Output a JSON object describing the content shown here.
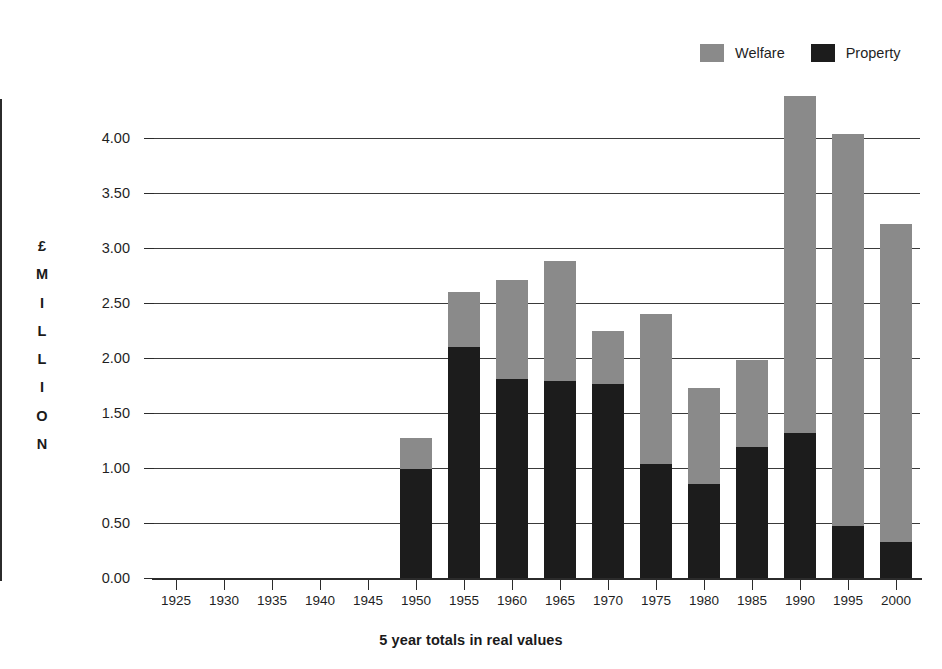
{
  "chart_data": {
    "type": "bar",
    "subtype": "stacked-bar",
    "title": "",
    "xlabel": "5 year totals in real values",
    "ylabel": "£ MILLION",
    "ylabel_letters": [
      "£",
      "M",
      "I",
      "L",
      "L",
      "I",
      "O",
      "N"
    ],
    "categories": [
      "1925",
      "1930",
      "1935",
      "1940",
      "1945",
      "1950",
      "1955",
      "1960",
      "1965",
      "1970",
      "1975",
      "1980",
      "1985",
      "1990",
      "1995",
      "2000"
    ],
    "series": [
      {
        "name": "Property",
        "color": "#1c1c1c",
        "values": [
          0,
          0,
          0,
          0,
          0,
          0.99,
          2.1,
          1.81,
          1.79,
          1.76,
          1.04,
          0.85,
          1.19,
          1.32,
          0.47,
          0.33
        ]
      },
      {
        "name": "Welfare",
        "color": "#8a8a8a",
        "values": [
          0,
          0,
          0,
          0,
          0,
          0.28,
          0.5,
          0.9,
          1.09,
          0.49,
          1.36,
          0.88,
          0.79,
          3.06,
          3.57,
          2.89
        ]
      }
    ],
    "totals": [
      0,
      0,
      0,
      0,
      0,
      1.27,
      2.6,
      2.71,
      2.88,
      2.25,
      2.4,
      1.73,
      1.98,
      4.38,
      4.04,
      3.22
    ],
    "ylim": [
      0,
      4.5
    ],
    "ytick_labels": [
      "0.00",
      "0.50",
      "1.00",
      "1.50",
      "2.00",
      "2.50",
      "3.00",
      "3.50",
      "4.00"
    ],
    "ytick_values": [
      0,
      0.5,
      1.0,
      1.5,
      2.0,
      2.5,
      3.0,
      3.5,
      4.0
    ],
    "grid": true,
    "grid_axis": "y",
    "legend": {
      "position": "top-right",
      "entries": [
        {
          "label": "Welfare",
          "color": "#8a8a8a"
        },
        {
          "label": "Property",
          "color": "#1c1c1c"
        }
      ]
    }
  }
}
